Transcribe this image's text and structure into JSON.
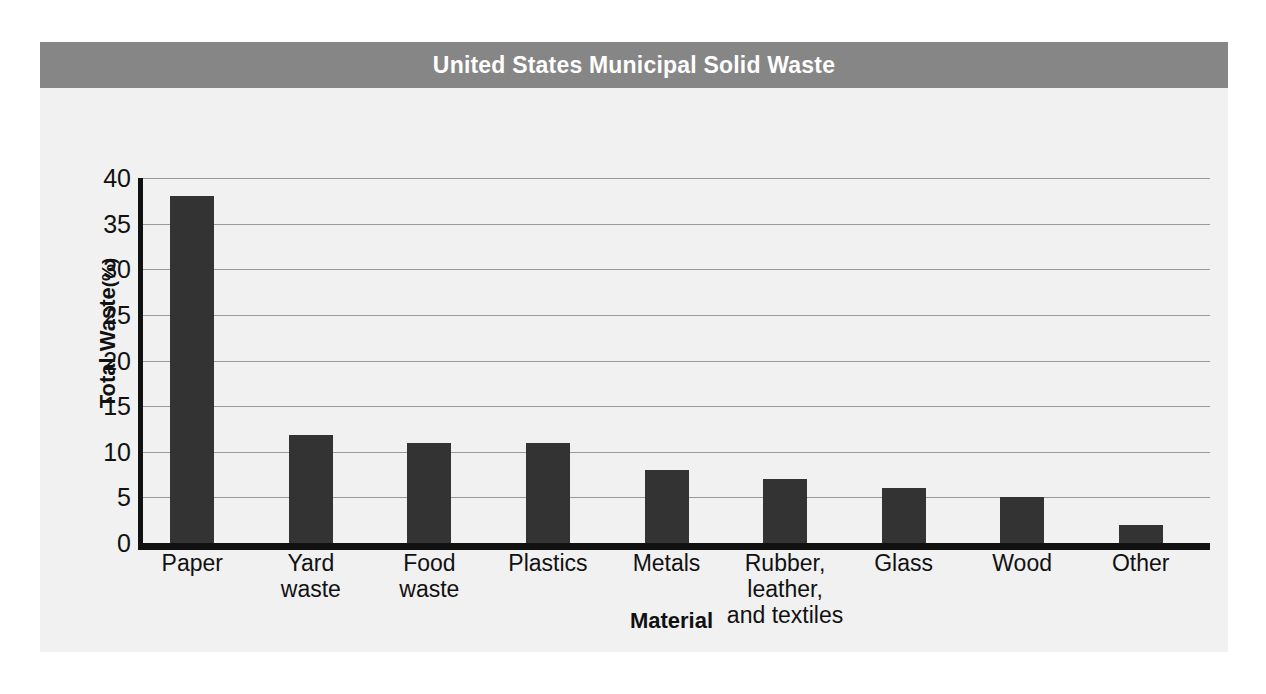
{
  "figure": {
    "title": "United States Municipal Solid Waste",
    "banner_color": "#868686",
    "panel_color": "#f1f1f1",
    "bar_color": "#333333",
    "axis_color": "#111111",
    "gridline_color": "#9a9a9a"
  },
  "chart_data": {
    "type": "bar",
    "title": "United States Municipal Solid Waste",
    "xlabel": "Material",
    "ylabel": "Total Waste (%)",
    "ylabel_main": "Total Waste",
    "ylabel_unit": "(%)",
    "ylim": [
      0,
      40
    ],
    "ytick_step": 5,
    "yticks": [
      0,
      5,
      10,
      15,
      20,
      25,
      30,
      35,
      40
    ],
    "ytick_labels": [
      "0",
      "5",
      "10",
      "15",
      "20",
      "25",
      "30",
      "35",
      "40"
    ],
    "grid": true,
    "legend": false,
    "categories": [
      "Paper",
      "Yard\nwaste",
      "Food\nwaste",
      "Plastics",
      "Metals",
      "Rubber,\nleather,\nand textiles",
      "Glass",
      "Wood",
      "Other"
    ],
    "values": [
      38,
      11.8,
      11,
      11,
      8,
      7,
      6,
      5,
      2
    ]
  }
}
